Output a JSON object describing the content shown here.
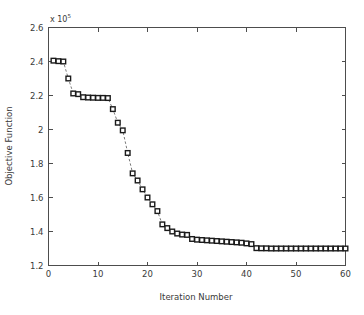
{
  "figure": {
    "background_color": "#ffffff",
    "axis_color": "#4d4d4d",
    "line_color": "#7a7a7a",
    "marker_edge_color": "#1a1a1a",
    "marker_face_color": "#ffffff"
  },
  "chart_data": {
    "type": "line",
    "title": "",
    "subtitle": "",
    "xlabel": "Iteration Number",
    "ylabel": "Objective Function",
    "y_exponent_label": "x 10",
    "y_exponent_value": "5",
    "y_multiplier": 100000,
    "xlim": [
      0,
      60
    ],
    "ylim": [
      1.2,
      2.6
    ],
    "xticks": [
      0,
      10,
      20,
      30,
      40,
      50,
      60
    ],
    "xticklabels": [
      "0",
      "10",
      "20",
      "30",
      "40",
      "50",
      "60"
    ],
    "yticks": [
      1.2,
      1.4,
      1.6,
      1.8,
      2.0,
      2.2,
      2.4,
      2.6
    ],
    "yticklabels": [
      "1.2",
      "1.4",
      "1.6",
      "1.8",
      "2",
      "2.2",
      "2.4",
      "2.6"
    ],
    "grid": false,
    "legend": false,
    "legend_position": "none",
    "marker": "square-open",
    "linestyle": "dashed",
    "series": [
      {
        "name": "Objective Function",
        "x": [
          1,
          2,
          3,
          4,
          5,
          6,
          7,
          8,
          9,
          10,
          11,
          12,
          13,
          14,
          15,
          16,
          17,
          18,
          19,
          20,
          21,
          22,
          23,
          24,
          25,
          26,
          27,
          28,
          29,
          30,
          31,
          32,
          33,
          34,
          35,
          36,
          37,
          38,
          39,
          40,
          41,
          42,
          43,
          44,
          45,
          46,
          47,
          48,
          49,
          50,
          51,
          52,
          53,
          54,
          55,
          56,
          57,
          58,
          59,
          60
        ],
        "values": [
          2.405,
          2.402,
          2.4,
          2.3,
          2.212,
          2.208,
          2.19,
          2.188,
          2.187,
          2.186,
          2.186,
          2.185,
          2.12,
          2.04,
          1.995,
          1.862,
          1.742,
          1.7,
          1.648,
          1.6,
          1.56,
          1.52,
          1.442,
          1.42,
          1.4,
          1.388,
          1.382,
          1.38,
          1.356,
          1.352,
          1.35,
          1.348,
          1.346,
          1.344,
          1.342,
          1.34,
          1.338,
          1.336,
          1.334,
          1.33,
          1.326,
          1.302,
          1.301,
          1.301,
          1.3,
          1.3,
          1.3,
          1.3,
          1.3,
          1.3,
          1.3,
          1.3,
          1.3,
          1.3,
          1.3,
          1.3,
          1.3,
          1.3,
          1.3,
          1.3
        ]
      }
    ]
  }
}
